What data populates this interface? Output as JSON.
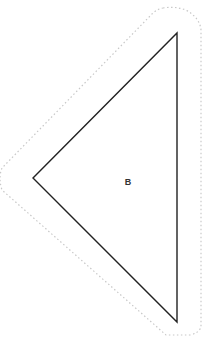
{
  "diagram": {
    "shape": "triangle",
    "label": "B",
    "vertices": {
      "left": [
        33,
        178
      ],
      "top": [
        177,
        33
      ],
      "bottom": [
        177,
        322
      ]
    },
    "label_position": [
      128,
      181
    ],
    "colors": {
      "background": "#ffffff",
      "triangle_stroke": "#222222",
      "offset_outline_stroke": "#c8c8c8",
      "label": "#333333"
    },
    "offset_outline": {
      "style": "dotted",
      "offset_px": 24
    }
  }
}
